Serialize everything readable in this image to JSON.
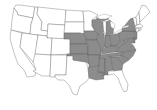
{
  "map": {
    "title": "",
    "region": "Contiguous United States",
    "colors": {
      "highlight": "#8c8c8c",
      "base": "#ffffff",
      "border": "#555555"
    },
    "highlighted_states": [
      "Nebraska",
      "Kansas",
      "Oklahoma",
      "Iowa",
      "Missouri",
      "Arkansas",
      "Louisiana",
      "Wisconsin",
      "Illinois",
      "Indiana",
      "Michigan",
      "Ohio",
      "Kentucky",
      "Tennessee",
      "Mississippi",
      "Alabama",
      "Georgia",
      "South Carolina",
      "North Carolina",
      "Virginia",
      "West Virginia",
      "Pennsylvania",
      "New York",
      "Maryland",
      "Delaware",
      "New Jersey"
    ],
    "unhighlighted_states": [
      "Washington",
      "Oregon",
      "California",
      "Idaho",
      "Nevada",
      "Montana",
      "Wyoming",
      "Utah",
      "Arizona",
      "Colorado",
      "New Mexico",
      "North Dakota",
      "South Dakota",
      "Minnesota",
      "Texas",
      "Florida",
      "Vermont",
      "New Hampshire",
      "Maine",
      "Massachusetts",
      "Connecticut",
      "Rhode Island"
    ]
  }
}
